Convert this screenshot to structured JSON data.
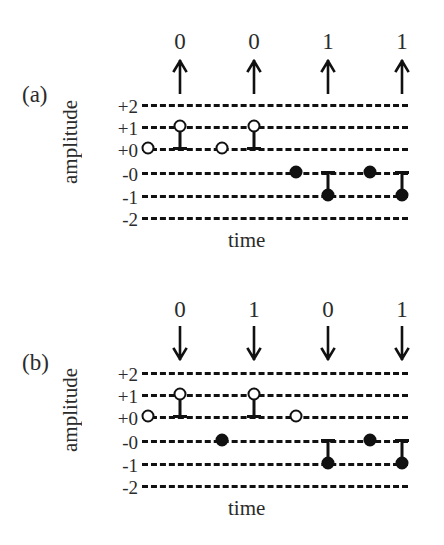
{
  "figure": {
    "background": "#ffffff",
    "ink": "#111111",
    "panels": [
      {
        "id": "a",
        "label": "(a)",
        "ylabel": "amplitude",
        "xlabel": "time",
        "arrow_direction": "up",
        "arrow_icon": "arrow-up-icon",
        "bits": [
          "0",
          "0",
          "1",
          "1"
        ],
        "yticks": [
          "+2",
          "+1",
          "+0",
          "-0",
          "-1",
          "-2"
        ]
      },
      {
        "id": "b",
        "label": "(b)",
        "ylabel": "amplitude",
        "xlabel": "time",
        "arrow_direction": "down",
        "arrow_icon": "arrow-down-icon",
        "bits": [
          "0",
          "1",
          "0",
          "1"
        ],
        "yticks": [
          "+2",
          "+1",
          "+0",
          "-0",
          "-1",
          "-2"
        ]
      }
    ]
  },
  "chart_data": [
    {
      "type": "scatter",
      "title": "(a)",
      "xlabel": "time",
      "ylabel": "amplitude",
      "grid": true,
      "legend": "none",
      "ytick_labels": [
        "+2",
        "+1",
        "+0",
        "-0",
        "-1",
        "-2"
      ],
      "ylevels": [
        2,
        1,
        0.5,
        -0.5,
        -1,
        -2
      ],
      "bits": [
        "0",
        "0",
        "1",
        "1"
      ],
      "arrow_direction": "up",
      "samples": [
        {
          "index": 1,
          "level": "+0",
          "marker": "open",
          "stem": "none"
        },
        {
          "index": 2,
          "level": "+1",
          "marker": "open",
          "stem": "down-to-+0"
        },
        {
          "index": 3,
          "level": "+0",
          "marker": "open",
          "stem": "none"
        },
        {
          "index": 4,
          "level": "+1",
          "marker": "open",
          "stem": "down-to-+0"
        },
        {
          "index": 5,
          "level": "-0",
          "marker": "filled",
          "stem": "none"
        },
        {
          "index": 6,
          "level": "-1",
          "marker": "filled",
          "stem": "up-to--0"
        },
        {
          "index": 7,
          "level": "-0",
          "marker": "filled",
          "stem": "none"
        },
        {
          "index": 8,
          "level": "-1",
          "marker": "filled",
          "stem": "up-to--0"
        }
      ]
    },
    {
      "type": "scatter",
      "title": "(b)",
      "xlabel": "time",
      "ylabel": "amplitude",
      "grid": true,
      "legend": "none",
      "ytick_labels": [
        "+2",
        "+1",
        "+0",
        "-0",
        "-1",
        "-2"
      ],
      "ylevels": [
        2,
        1,
        0.5,
        -0.5,
        -1,
        -2
      ],
      "bits": [
        "0",
        "1",
        "0",
        "1"
      ],
      "arrow_direction": "down",
      "samples": [
        {
          "index": 1,
          "level": "+0",
          "marker": "open",
          "stem": "none"
        },
        {
          "index": 2,
          "level": "+1",
          "marker": "open",
          "stem": "down-to-+0"
        },
        {
          "index": 3,
          "level": "-0",
          "marker": "filled",
          "stem": "none"
        },
        {
          "index": 4,
          "level": "+1",
          "marker": "open",
          "stem": "down-to-+0"
        },
        {
          "index": 5,
          "level": "+0",
          "marker": "open",
          "stem": "none"
        },
        {
          "index": 6,
          "level": "-1",
          "marker": "filled",
          "stem": "up-to--0"
        },
        {
          "index": 7,
          "level": "-0",
          "marker": "filled",
          "stem": "none"
        },
        {
          "index": 8,
          "level": "-1",
          "marker": "filled",
          "stem": "up-to--0"
        }
      ]
    }
  ]
}
